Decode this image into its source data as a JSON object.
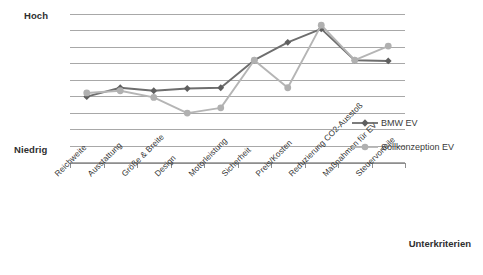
{
  "chart_data": {
    "type": "line",
    "title": "",
    "xlabel": "Unterkriterien",
    "ylabel": "",
    "grid": true,
    "legend_position": "right-inside",
    "ylim": [
      0,
      10
    ],
    "y_axis_ticks": [
      "Niedrig",
      "Hoch"
    ],
    "gridline_count": 10,
    "categories": [
      "Reichweite",
      "Ausstattung",
      "Größe & Breite",
      "Design",
      "Motorleistung",
      "Sicherheit",
      "Preis/Kosten",
      "Reduzierung CO2-Ausstoß",
      "Maßnahmen für EV",
      "Steuervorteile"
    ],
    "series": [
      {
        "name": "BMW EV",
        "color": "#6e6e6e",
        "marker": "diamond",
        "values": [
          4.45,
          5.05,
          4.85,
          5.0,
          5.05,
          6.9,
          8.1,
          9.0,
          6.9,
          6.85
        ]
      },
      {
        "name": "Sollkonzeption EV",
        "color": "#b5b5b5",
        "marker": "circle",
        "values": [
          4.7,
          4.85,
          4.4,
          3.35,
          3.7,
          6.9,
          5.05,
          9.25,
          6.9,
          7.85
        ]
      }
    ]
  },
  "axis": {
    "y_high_label": "Hoch",
    "y_low_label": "Niedrig",
    "x_title": "Unterkriterien"
  },
  "legend": {
    "items": [
      {
        "label": "BMW EV",
        "color": "#6e6e6e",
        "marker": "diamond"
      },
      {
        "label": "Sollkonzeption EV",
        "color": "#b5b5b5",
        "marker": "circle"
      }
    ]
  },
  "colors": {
    "bmw_series": "#6e6e6e",
    "soll_series": "#b5b5b5",
    "gridline": "#a8a8a8",
    "axis": "#8e8e8e",
    "text": "#333333",
    "background": "#ffffff"
  }
}
